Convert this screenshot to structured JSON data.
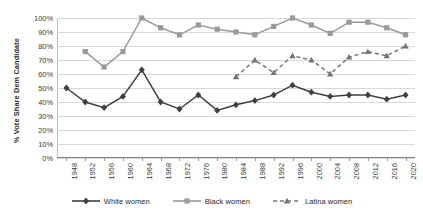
{
  "chart_data": {
    "type": "line",
    "title": "",
    "xlabel": "",
    "ylabel": "% Vote Share Dem Candidate",
    "ylim": [
      0,
      100
    ],
    "ytick_labels": [
      "0%",
      "10%",
      "20%",
      "30%",
      "40%",
      "50%",
      "60%",
      "70%",
      "80%",
      "90%",
      "100%"
    ],
    "ytick_values": [
      0,
      10,
      20,
      30,
      40,
      50,
      60,
      70,
      80,
      90,
      100
    ],
    "grid": true,
    "legend_position": "bottom",
    "categories": [
      1948,
      1952,
      1956,
      1960,
      1964,
      1968,
      1972,
      1976,
      1980,
      1984,
      1988,
      1992,
      1996,
      2000,
      2004,
      2008,
      2012,
      2016,
      2020
    ],
    "xtick_labels": [
      "1948",
      "1952",
      "1956",
      "1960",
      "1964",
      "1968",
      "1972",
      "1976",
      "1980",
      "1984",
      "1988",
      "1992",
      "1996",
      "2000",
      "2004",
      "2008",
      "2012",
      "2016",
      "2020"
    ],
    "series": [
      {
        "name": "White women",
        "color": "#404040",
        "marker": "diamond",
        "dash": "solid",
        "x": [
          1948,
          1952,
          1956,
          1960,
          1964,
          1968,
          1972,
          1976,
          1980,
          1984,
          1988,
          1992,
          1996,
          2000,
          2004,
          2008,
          2012,
          2016,
          2020
        ],
        "values": [
          50,
          40,
          36,
          44,
          63,
          40,
          35,
          45,
          34,
          38,
          41,
          45,
          52,
          47,
          44,
          45,
          45,
          42,
          45
        ]
      },
      {
        "name": "Black women",
        "color": "#9a9a9a",
        "marker": "square",
        "dash": "solid",
        "x": [
          1952,
          1956,
          1960,
          1964,
          1968,
          1972,
          1976,
          1980,
          1984,
          1988,
          1992,
          1996,
          2000,
          2004,
          2008,
          2012,
          2016,
          2020
        ],
        "values": [
          76,
          65,
          76,
          100,
          93,
          88,
          95,
          92,
          90,
          88,
          94,
          100,
          95,
          89,
          97,
          97,
          93,
          88
        ]
      },
      {
        "name": "Latina women",
        "color": "#767676",
        "marker": "triangle",
        "dash": "dashed",
        "x": [
          1984,
          1988,
          1992,
          1996,
          2000,
          2004,
          2008,
          2012,
          2016,
          2020
        ],
        "values": [
          58,
          70,
          61,
          73,
          70,
          60,
          72,
          76,
          73,
          80
        ]
      }
    ]
  },
  "legend": {
    "items": [
      {
        "label": "White women"
      },
      {
        "label": "Black women"
      },
      {
        "label": "Latina women"
      }
    ]
  }
}
